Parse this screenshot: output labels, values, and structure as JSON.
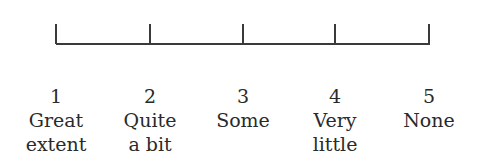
{
  "scale": {
    "points": [
      {
        "value": "1",
        "label_line1": "Great",
        "label_line2": "extent",
        "x": 56
      },
      {
        "value": "2",
        "label_line1": "Quite",
        "label_line2": "a bit",
        "x": 150
      },
      {
        "value": "3",
        "label_line1": "Some",
        "label_line2": "",
        "x": 243
      },
      {
        "value": "4",
        "label_line1": "Very",
        "label_line2": "little",
        "x": 335
      },
      {
        "value": "5",
        "label_line1": "None",
        "label_line2": "",
        "x": 429
      }
    ],
    "line_color": "#3a3a3a",
    "text_color": "#2a2a2a"
  }
}
